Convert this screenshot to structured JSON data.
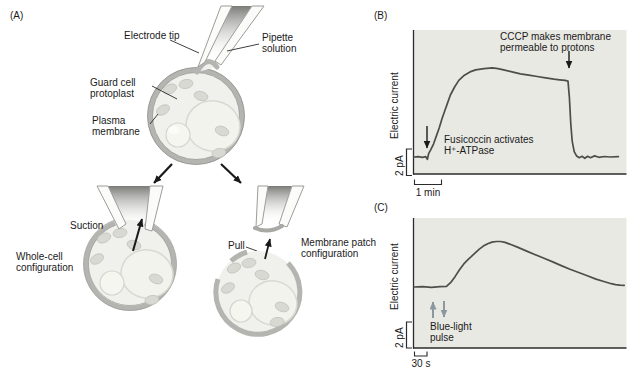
{
  "panel_a": {
    "tag": "(A)",
    "labels": {
      "electrode_tip": "Electrode tip",
      "pipette_solution": "Pipette solution",
      "guard_cell_protoplast": "Guard cell protoplast",
      "plasma_membrane": "Plasma membrane",
      "suction": "Suction",
      "whole_cell_configuration": "Whole-cell configuration",
      "pull": "Pull",
      "membrane_patch_configuration": "Membrane patch configuration"
    }
  },
  "panel_b": {
    "tag": "(B)",
    "y_axis_label": "Electric current",
    "y_scale_label": "2 pA",
    "x_scale_label": "1 min",
    "annotations": {
      "fusicoccin": "Fusicoccin activates H⁺-ATPase",
      "cccp": "CCCP makes membrane permeable to protons"
    }
  },
  "panel_c": {
    "tag": "(C)",
    "y_axis_label": "Electric current",
    "y_scale_label": "2 pA",
    "x_scale_label": "30 s",
    "annotations": {
      "blue_light": "Blue-light pulse"
    }
  },
  "colors": {
    "plot_background": "#e9e9e4",
    "trace": "#4d4d4a",
    "axis": "#2b2b2b",
    "membrane_gray": "#b4b4b0",
    "blue_light_arrow": "#8b98a0",
    "text": "#1a1a1a"
  },
  "chart_data": [
    {
      "type": "line",
      "panel": "B",
      "ylabel": "Electric current",
      "y_scale_bar": "2 pA",
      "x_scale_bar": "1 min",
      "x_units": "min",
      "y_units": "pA (relative to baseline)",
      "grid": false,
      "axes_visible": {
        "left": true,
        "bottom": true,
        "top": false,
        "right": false
      },
      "annotations": [
        {
          "text": "Fusicoccin activates H⁺-ATPase",
          "at_x_min": 0.5
        },
        {
          "text": "CCCP makes membrane permeable to protons",
          "at_x_min": 5.5
        }
      ],
      "series": [
        {
          "name": "H+-ATPase pump current",
          "points": [
            [
              0,
              0
            ],
            [
              0.15,
              0.03
            ],
            [
              0.3,
              -0.03
            ],
            [
              0.42,
              0.02
            ],
            [
              0.48,
              -0.18
            ],
            [
              0.52,
              0.25
            ],
            [
              0.6,
              0.55
            ],
            [
              0.7,
              1.0
            ],
            [
              0.8,
              1.6
            ],
            [
              0.9,
              2.2
            ],
            [
              1.0,
              2.9
            ],
            [
              1.1,
              3.5
            ],
            [
              1.2,
              4.1
            ],
            [
              1.3,
              4.7
            ],
            [
              1.45,
              5.3
            ],
            [
              1.6,
              5.8
            ],
            [
              1.8,
              6.2
            ],
            [
              2.0,
              6.45
            ],
            [
              2.2,
              6.6
            ],
            [
              2.5,
              6.7
            ],
            [
              2.8,
              6.75
            ],
            [
              3.0,
              6.7
            ],
            [
              3.2,
              6.6
            ],
            [
              3.5,
              6.45
            ],
            [
              3.8,
              6.3
            ],
            [
              4.1,
              6.2
            ],
            [
              4.4,
              6.1
            ],
            [
              4.7,
              6.0
            ],
            [
              5.0,
              5.9
            ],
            [
              5.2,
              5.85
            ],
            [
              5.4,
              5.8
            ],
            [
              5.5,
              5.75
            ],
            [
              5.55,
              4.5
            ],
            [
              5.6,
              2.5
            ],
            [
              5.65,
              1.2
            ],
            [
              5.72,
              0.4
            ],
            [
              5.8,
              0.1
            ],
            [
              5.9,
              -0.05
            ],
            [
              6.0,
              0.05
            ],
            [
              6.1,
              -0.1
            ],
            [
              6.2,
              0.05
            ],
            [
              6.3,
              -0.05
            ],
            [
              6.45,
              0.08
            ],
            [
              6.6,
              -0.02
            ],
            [
              6.8,
              0.04
            ],
            [
              7.0,
              0
            ],
            [
              7.3,
              0.02
            ]
          ]
        }
      ],
      "render": {
        "x_px_origin": 414,
        "x_px_per_unit": 28,
        "y_px_baseline": 157,
        "y_px_per_unit": 13.2
      }
    },
    {
      "type": "line",
      "panel": "C",
      "ylabel": "Electric current",
      "y_scale_bar": "2 pA",
      "x_scale_bar": "30 s",
      "x_units": "s",
      "y_units": "pA (relative to baseline)",
      "grid": false,
      "axes_visible": {
        "left": true,
        "bottom": true,
        "top": false,
        "right": false
      },
      "annotations": [
        {
          "text": "Blue-light pulse",
          "at_x_s": 55
        }
      ],
      "series": [
        {
          "name": "Blue-light-induced current",
          "points": [
            [
              0,
              0
            ],
            [
              20,
              0.02
            ],
            [
              40,
              -0.02
            ],
            [
              60,
              0.02
            ],
            [
              75,
              0.05
            ],
            [
              85,
              0.35
            ],
            [
              95,
              0.8
            ],
            [
              105,
              1.3
            ],
            [
              115,
              1.75
            ],
            [
              125,
              2.1
            ],
            [
              132,
              2.3
            ],
            [
              140,
              2.55
            ],
            [
              150,
              2.85
            ],
            [
              160,
              3.1
            ],
            [
              170,
              3.28
            ],
            [
              180,
              3.4
            ],
            [
              190,
              3.45
            ],
            [
              200,
              3.45
            ],
            [
              210,
              3.38
            ],
            [
              225,
              3.2
            ],
            [
              240,
              3.0
            ],
            [
              260,
              2.72
            ],
            [
              280,
              2.45
            ],
            [
              300,
              2.18
            ],
            [
              320,
              1.9
            ],
            [
              340,
              1.62
            ],
            [
              360,
              1.35
            ],
            [
              380,
              1.1
            ],
            [
              400,
              0.85
            ],
            [
              420,
              0.6
            ],
            [
              440,
              0.4
            ],
            [
              455,
              0.25
            ],
            [
              465,
              0.18
            ],
            [
              475,
              0.14
            ],
            [
              485,
              0.12
            ]
          ]
        }
      ],
      "render": {
        "x_px_origin": 414,
        "x_px_per_unit": 0.4333,
        "y_px_baseline": 287,
        "y_px_per_unit": 13.2
      }
    }
  ]
}
